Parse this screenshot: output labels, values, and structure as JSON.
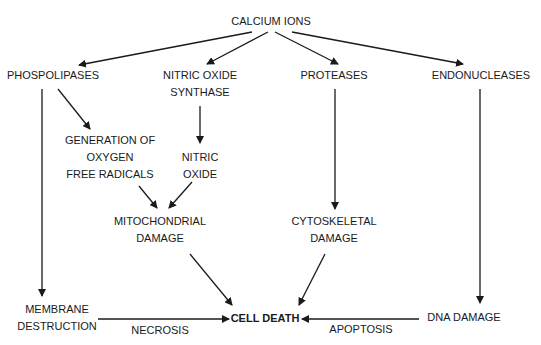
{
  "diagram": {
    "type": "flowchart",
    "nodes": {
      "calcium_ions": {
        "lines": [
          "CALCIUM IONS"
        ]
      },
      "phospholipases": {
        "lines": [
          "PHOSPOLIPASES"
        ]
      },
      "nitric_oxide_synthase": {
        "lines": [
          "NITRIC OXIDE",
          "SYNTHASE"
        ]
      },
      "proteases": {
        "lines": [
          "PROTEASES"
        ]
      },
      "endonucleases": {
        "lines": [
          "ENDONUCLEASES"
        ]
      },
      "oxygen_free_radicals": {
        "lines": [
          "GENERATION OF",
          "OXYGEN",
          "FREE RADICALS"
        ]
      },
      "nitric_oxide": {
        "lines": [
          "NITRIC",
          "OXIDE"
        ]
      },
      "mitochondrial_damage": {
        "lines": [
          "MITOCHONDRIAL",
          "DAMAGE"
        ]
      },
      "cytoskeletal_damage": {
        "lines": [
          "CYTOSKELETAL",
          "DAMAGE"
        ]
      },
      "membrane_destruction": {
        "lines": [
          "MEMBRANE",
          "DESTRUCTION"
        ]
      },
      "cell_death": {
        "lines": [
          "CELL DEATH"
        ]
      },
      "dna_damage": {
        "lines": [
          "DNA DAMAGE"
        ]
      }
    },
    "edge_labels": {
      "necrosis": "NECROSIS",
      "apoptosis": "APOPTOSIS"
    },
    "edges": [
      {
        "from": "CALCIUM IONS",
        "to": "PHOSPOLIPASES"
      },
      {
        "from": "CALCIUM IONS",
        "to": "NITRIC OXIDE SYNTHASE"
      },
      {
        "from": "CALCIUM IONS",
        "to": "PROTEASES"
      },
      {
        "from": "CALCIUM IONS",
        "to": "ENDONUCLEASES"
      },
      {
        "from": "PHOSPOLIPASES",
        "to": "GENERATION OF OXYGEN FREE RADICALS"
      },
      {
        "from": "PHOSPOLIPASES",
        "to": "MEMBRANE DESTRUCTION"
      },
      {
        "from": "NITRIC OXIDE SYNTHASE",
        "to": "NITRIC OXIDE"
      },
      {
        "from": "GENERATION OF OXYGEN FREE RADICALS",
        "to": "MITOCHONDRIAL DAMAGE"
      },
      {
        "from": "NITRIC OXIDE",
        "to": "MITOCHONDRIAL DAMAGE"
      },
      {
        "from": "PROTEASES",
        "to": "CYTOSKELETAL DAMAGE"
      },
      {
        "from": "ENDONUCLEASES",
        "to": "DNA DAMAGE"
      },
      {
        "from": "MITOCHONDRIAL DAMAGE",
        "to": "CELL DEATH"
      },
      {
        "from": "CYTOSKELETAL DAMAGE",
        "to": "CELL DEATH"
      },
      {
        "from": "MEMBRANE DESTRUCTION",
        "to": "CELL DEATH",
        "label": "NECROSIS"
      },
      {
        "from": "DNA DAMAGE",
        "to": "CELL DEATH",
        "label": "APOPTOSIS"
      }
    ]
  }
}
